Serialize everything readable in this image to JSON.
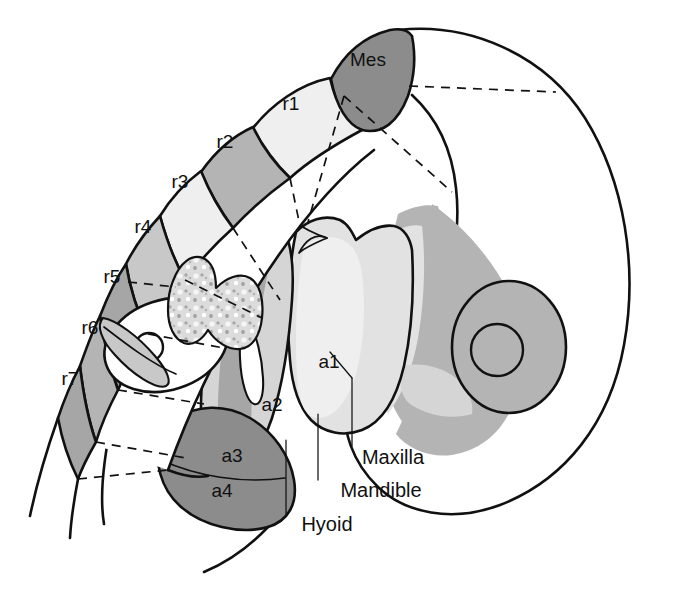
{
  "figure": {
    "type": "diagram",
    "background_color": "#ffffff",
    "line_color": "#111111"
  },
  "palette": {
    "white": "#ffffff",
    "very_light_gray": "#efefef",
    "light_gray": "#e2e2e2",
    "pale_gray": "#d5d5d5",
    "mid_light_gray": "#c8c8c8",
    "mid_gray": "#b4b4b4",
    "gray": "#a6a6a6",
    "dark_gray": "#8c8c8c",
    "darker_gray": "#7e7e7e"
  },
  "neural_segments": [
    {
      "id": "mes",
      "label": "Mes",
      "shade": "#8c8c8c",
      "label_x": 368,
      "label_y": 66
    },
    {
      "id": "r1",
      "label": "r1",
      "shade": "#efefef",
      "label_x": 291,
      "label_y": 110
    },
    {
      "id": "r2",
      "label": "r2",
      "shade": "#b4b4b4",
      "label_x": 225,
      "label_y": 148
    },
    {
      "id": "r3",
      "label": "r3",
      "shade": "#efefef",
      "label_x": 180,
      "label_y": 188
    },
    {
      "id": "r4",
      "label": "r4",
      "shade": "#c8c8c8",
      "label_x": 143,
      "label_y": 233
    },
    {
      "id": "r5",
      "label": "r5",
      "shade": "#a6a6a6",
      "label_x": 112,
      "label_y": 283
    },
    {
      "id": "r6",
      "label": "r6",
      "shade": "#b4b4b4",
      "label_x": 90,
      "label_y": 334
    },
    {
      "id": "r7",
      "label": "r7",
      "shade": "#a6a6a6",
      "label_x": 70,
      "label_y": 385
    }
  ],
  "pharyngeal_arches": [
    {
      "id": "a1",
      "label": "a1",
      "shade": "#e2e2e2",
      "label_x": 329,
      "label_y": 368
    },
    {
      "id": "a2",
      "label": "a2",
      "shade": "#d5d5d5",
      "label_x": 272,
      "label_y": 411
    },
    {
      "id": "a3",
      "label": "a3",
      "shade": "#8c8c8c",
      "label_x": 232,
      "label_y": 462
    },
    {
      "id": "a4",
      "label": "a4",
      "shade": "#8c8c8c",
      "label_x": 222,
      "label_y": 497
    }
  ],
  "callouts": [
    {
      "id": "maxilla",
      "label": "Maxilla",
      "label_x": 351,
      "label_y": 464
    },
    {
      "id": "mandible",
      "label": "Mandible",
      "label_x": 333,
      "label_y": 497
    },
    {
      "id": "hyoid",
      "label": "Hyoid",
      "label_x": 301,
      "label_y": 531
    }
  ],
  "structures": [
    {
      "id": "head-outline",
      "name": "embryonic head and body outline"
    },
    {
      "id": "eye",
      "name": "optic vesicle / eye with lens"
    },
    {
      "id": "otic-vesicle",
      "name": "otic vesicle"
    },
    {
      "id": "ganglion",
      "name": "stippled cranial ganglion"
    },
    {
      "id": "migration-paths",
      "name": "dashed neural crest migration streams"
    }
  ]
}
